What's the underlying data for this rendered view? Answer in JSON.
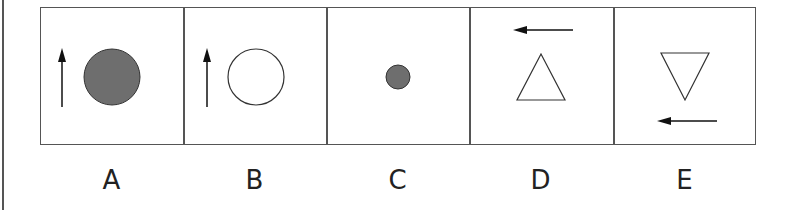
{
  "figure": {
    "options": [
      {
        "label": "A",
        "shape": "circle",
        "size": "large",
        "fill": "#6e6e6e",
        "arrow": "up",
        "arrow_position": "left"
      },
      {
        "label": "B",
        "shape": "circle",
        "size": "large",
        "fill": "none",
        "arrow": "up",
        "arrow_position": "left"
      },
      {
        "label": "C",
        "shape": "circle",
        "size": "small",
        "fill": "#6e6e6e",
        "arrow": "none"
      },
      {
        "label": "D",
        "shape": "triangle-up",
        "fill": "none",
        "arrow": "left",
        "arrow_position": "top"
      },
      {
        "label": "E",
        "shape": "triangle-down",
        "fill": "none",
        "arrow": "left",
        "arrow_position": "bottom"
      }
    ]
  }
}
